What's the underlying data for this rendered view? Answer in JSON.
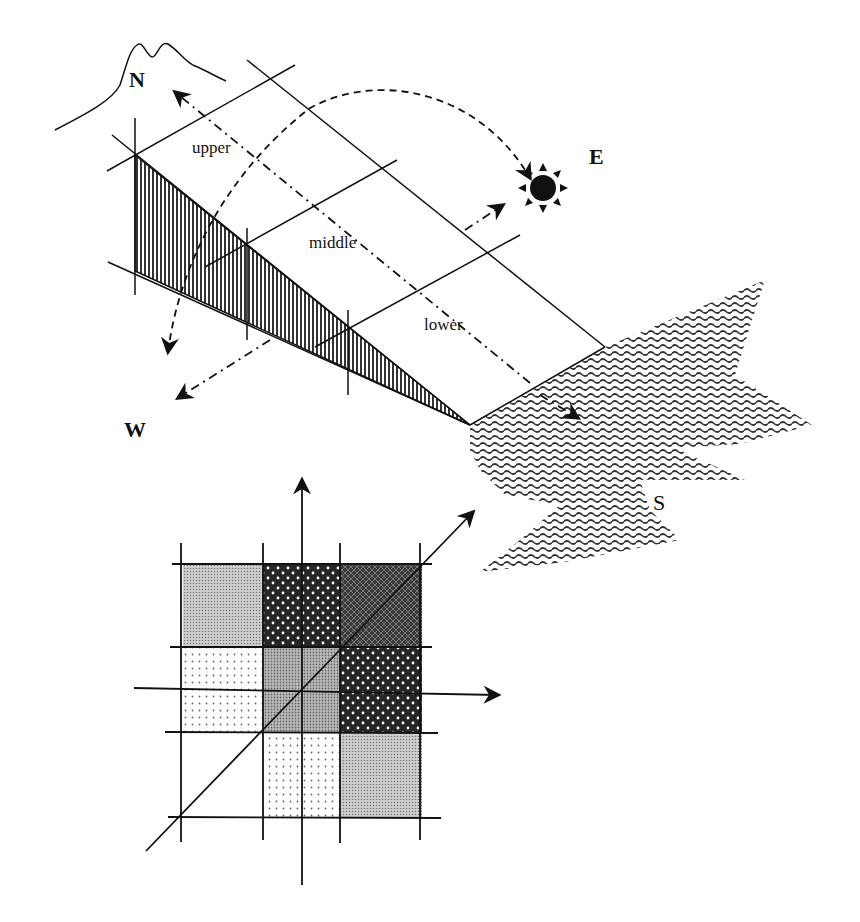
{
  "diagram": {
    "compass": {
      "north": "N",
      "east": "E",
      "west": "W",
      "south": "S"
    },
    "slope_sections": {
      "upper": "upper",
      "middle": "middle",
      "lower": "lower"
    },
    "icons": {
      "sun": "sun-icon",
      "mountain": "mountain-outline",
      "sea": "sea-wave-region"
    },
    "grid": {
      "rows": 4,
      "cols": 4,
      "cells": [
        [
          "light-gray-fine-dot",
          "dark-white-dots",
          "dark-crosshatch",
          "none"
        ],
        [
          "sparse-dot",
          "medium-gray",
          "dark-white-dots",
          "none"
        ],
        [
          "none",
          "sparse-dot",
          "light-gray-fine-dot",
          "none"
        ]
      ],
      "axes": [
        "vertical-up",
        "horizontal-right",
        "diagonal-up-right"
      ]
    },
    "colors": {
      "ink": "#111111",
      "hatch_fill": "#555555",
      "sea_wave": "#333333",
      "background": "#ffffff"
    }
  }
}
